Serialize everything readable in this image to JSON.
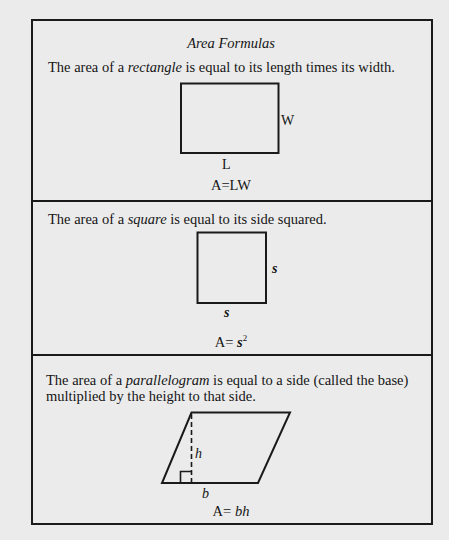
{
  "title": "Area Formulas",
  "sections": [
    {
      "id": "rectangle",
      "text_before": "The area of a ",
      "term": "rectangle",
      "text_after": " is equal to its length times its width.",
      "labels": {
        "side": "W",
        "bottom": "L"
      },
      "formula": {
        "prefix": "A",
        "eq": "=",
        "expr": "LW"
      }
    },
    {
      "id": "square",
      "text_before": "The area of a ",
      "term": "square",
      "text_after": " is equal to its side squared.",
      "labels": {
        "side": "s",
        "bottom": "s"
      },
      "formula": {
        "prefix": "A",
        "eq": "=",
        "base": "s",
        "exponent": "2"
      }
    },
    {
      "id": "parallelogram",
      "text_before": "The area of a ",
      "term": "parallelogram",
      "text_after": " is equal to a side (called the base)",
      "line2": "multiplied by the height to that side.",
      "labels": {
        "height": "h",
        "base": "b"
      },
      "formula": {
        "prefix": "A",
        "eq": "=",
        "expr": "bh"
      }
    }
  ],
  "colors": {
    "background": "#ebebeb",
    "ink": "#1a1a1a"
  }
}
